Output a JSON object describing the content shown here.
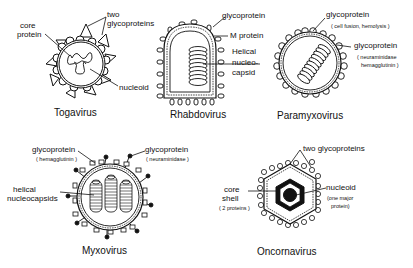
{
  "viruses": [
    {
      "name": "Togavirus",
      "labels": {
        "core": "core",
        "core2": "protein",
        "glyco": "two",
        "glyco2": "glycoproteins",
        "nucleoid": "nucleoid"
      }
    },
    {
      "name": "Rhabdovirus",
      "labels": {
        "glyco": "glycoprotein",
        "m_protein": "M protein",
        "helical1": "Helical",
        "helical2": "nucleo-",
        "helical3": "capsid"
      }
    },
    {
      "name": "Paramyxovirus",
      "labels": {
        "glyco1": "glycoprotein",
        "glyco1_sub": "( cell fusion, hemolysis )",
        "glyco2": "glycoprotein",
        "glyco2_sub1": "( neuraminidase",
        "glyco2_sub2": "hemagglutinin )"
      }
    },
    {
      "name": "Myxovirus",
      "labels": {
        "glyco1": "glycoprotein",
        "glyco1_sub": "( hemagglutinin )",
        "glyco2": "glycoprotein",
        "glyco2_sub": "( neuraminidase )",
        "helical1": "helical",
        "helical2": "nucleocapsids"
      }
    },
    {
      "name": "Oncornavirus",
      "labels": {
        "glyco": "two glycoproteins",
        "core1": "core",
        "core2": "shell",
        "core_sub": "( 2 proteins )",
        "nucleoid": "nucleoid",
        "nucleoid_sub1": "(one major",
        "nucleoid_sub2": "protein)"
      }
    }
  ]
}
